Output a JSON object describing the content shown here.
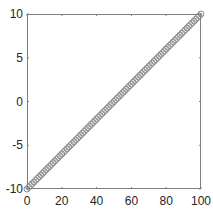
{
  "chart_data": {
    "type": "scatter",
    "title": "",
    "xlabel": "",
    "ylabel": "",
    "xlim": [
      0,
      100
    ],
    "ylim": [
      -10,
      10
    ],
    "grid": false,
    "box": true,
    "x_ticks": [
      0,
      20,
      40,
      60,
      80,
      100
    ],
    "y_ticks": [
      -10,
      -5,
      0,
      5,
      10
    ],
    "series": [
      {
        "name": "data",
        "marker": "open-circle",
        "color": "#8c8c8c",
        "x_start": 0,
        "x_end": 100,
        "n_points": 101,
        "relation": "y = -10 + 0.2 * x",
        "x": [
          0,
          10,
          20,
          30,
          40,
          50,
          60,
          70,
          80,
          90,
          100
        ],
        "y": [
          -10,
          -8,
          -6,
          -4,
          -2,
          0,
          2,
          4,
          6,
          8,
          10
        ]
      }
    ],
    "legend": null
  },
  "style": {
    "axis_color": "#808080",
    "text_color": "#262626",
    "marker_color": "#8c8c8c"
  }
}
